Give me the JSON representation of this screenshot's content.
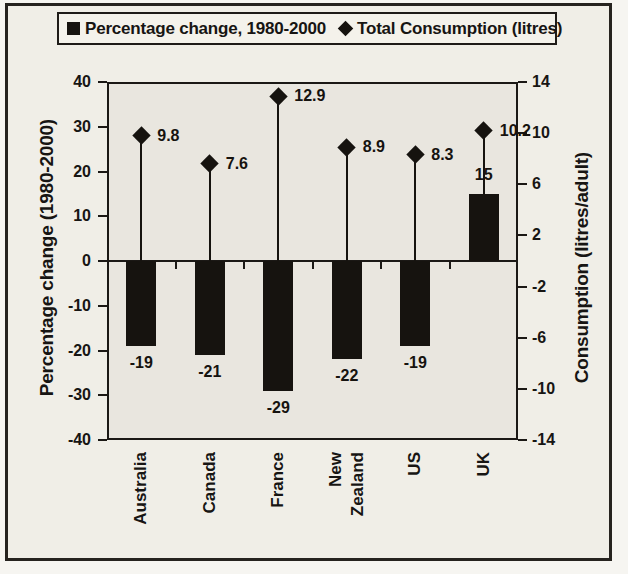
{
  "ui": {
    "legend": [
      {
        "marker": "square",
        "label": "Percentage change, 1980-2000"
      },
      {
        "marker": "diamond",
        "label": "Total Consumption (litres)"
      }
    ]
  },
  "chart_data": {
    "type": "bar",
    "subtype": "combo-bar-scatter",
    "categories": [
      "Australia",
      "Canada",
      "France",
      "New Zealand",
      "US",
      "UK"
    ],
    "series": [
      {
        "name": "Percentage change, 1980-2000",
        "type": "bar",
        "axis": "left",
        "values": [
          -19,
          -21,
          -29,
          -22,
          -19,
          15
        ],
        "color": "#16130f"
      },
      {
        "name": "Total Consumption (litres)",
        "type": "scatter",
        "axis": "right",
        "marker": "diamond",
        "drop_lines": true,
        "values": [
          9.8,
          7.6,
          12.9,
          8.9,
          8.3,
          10.2
        ],
        "color": "#16130f"
      }
    ],
    "left_axis": {
      "label": "Percentage change (1980-2000)",
      "min": -40,
      "max": 40,
      "ticks": [
        40,
        30,
        20,
        10,
        0,
        -10,
        -20,
        -30,
        -40
      ]
    },
    "right_axis": {
      "label": "Consumption (litres/adult)",
      "min": -14,
      "max": 14,
      "ticks": [
        14,
        10,
        6,
        2,
        -2,
        -6,
        -10,
        -14
      ]
    },
    "data_labels": true,
    "grid": false,
    "legend_position": "top",
    "plot_bg": "#e9e6df",
    "ink": "#16130f"
  }
}
